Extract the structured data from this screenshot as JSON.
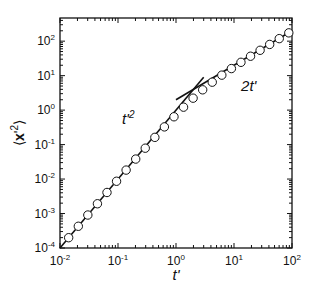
{
  "chart_data": {
    "type": "scatter",
    "title": "",
    "xlabel": "t'",
    "ylabel": "⟨x'²⟩",
    "xscale": "log",
    "yscale": "log",
    "xlim": [
      0.01,
      100
    ],
    "ylim": [
      0.0001,
      470
    ],
    "grid": false,
    "legend": null,
    "x_ticks": [
      {
        "exp": "-2",
        "value": 0.01
      },
      {
        "exp": "-1",
        "value": 0.1
      },
      {
        "exp": "0",
        "value": 1
      },
      {
        "exp": "1",
        "value": 10
      },
      {
        "exp": "2",
        "value": 100
      }
    ],
    "y_ticks": [
      {
        "exp": "-4",
        "value": 0.0001
      },
      {
        "exp": "-3",
        "value": 0.001
      },
      {
        "exp": "-2",
        "value": 0.01
      },
      {
        "exp": "-1",
        "value": 0.1
      },
      {
        "exp": "0",
        "value": 1
      },
      {
        "exp": "1",
        "value": 10
      },
      {
        "exp": "2",
        "value": 100
      }
    ],
    "series": [
      {
        "name": "simulation",
        "style": "open-circles",
        "x": [
          0.0141,
          0.0207,
          0.0302,
          0.0442,
          0.0646,
          0.0944,
          0.138,
          0.202,
          0.295,
          0.432,
          0.631,
          0.923,
          1.349,
          1.972,
          2.884,
          4.217,
          6.166,
          9.016,
          13.18,
          19.28,
          28.18,
          41.21,
          60.26,
          88.1
        ],
        "y": [
          0.000199,
          0.000427,
          0.000905,
          0.00192,
          0.00408,
          0.00863,
          0.0182,
          0.038,
          0.0786,
          0.162,
          0.326,
          0.641,
          1.217,
          2.222,
          3.88,
          6.46,
          10.34,
          16.03,
          24.36,
          36.56,
          54.36,
          80.42,
          118.5,
          174.2
        ]
      },
      {
        "name": "t'^2",
        "style": "line",
        "x": [
          0.01,
          3.0
        ],
        "y": [
          0.0001,
          9.0
        ]
      },
      {
        "name": "2t'",
        "style": "line",
        "x": [
          1.0,
          100
        ],
        "y": [
          2.0,
          200
        ]
      }
    ],
    "annotations": [
      {
        "text": "t'",
        "sup": "2",
        "x": 0.15,
        "y": 0.4
      },
      {
        "text": "2t'",
        "x": 18,
        "y": 3.5
      }
    ]
  }
}
